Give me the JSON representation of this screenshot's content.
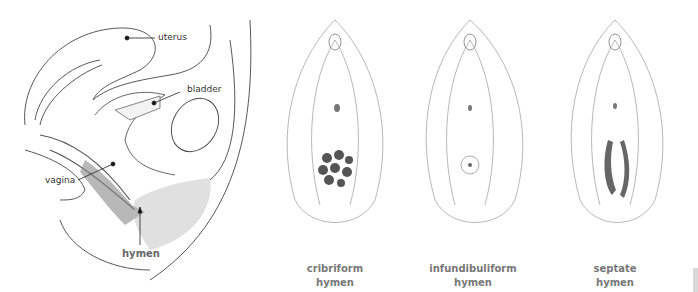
{
  "cross_section": {
    "labels": {
      "uterus": "uterus",
      "bladder": "bladder",
      "vagina": "vagina",
      "hymen": "hymen"
    }
  },
  "variants": [
    {
      "line1": "cribriform",
      "line2": "hymen"
    },
    {
      "line1": "infundibuliform",
      "line2": "hymen"
    },
    {
      "line1": "septate",
      "line2": "hymen"
    }
  ]
}
